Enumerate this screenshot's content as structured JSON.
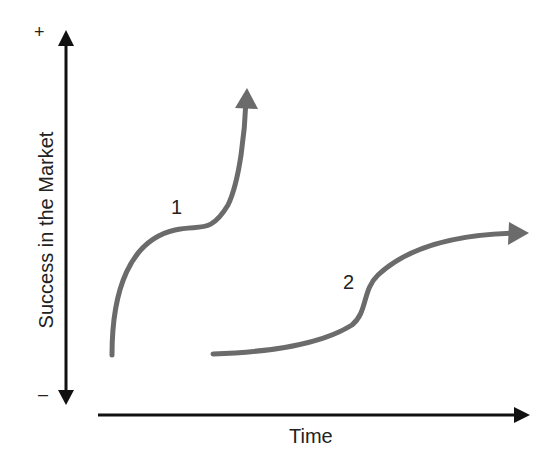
{
  "diagram": {
    "y_axis_label": "Success in the Market",
    "x_axis_label": "Time",
    "y_axis_top_marker": "+",
    "y_axis_bottom_marker": "–",
    "curves": [
      {
        "label": "1",
        "description": "steep rise, plateau, then sharp rise"
      },
      {
        "label": "2",
        "description": "slow rise, S-bend, then leveling off"
      }
    ],
    "colors": {
      "axis": "#111111",
      "curve": "#6b6b6b",
      "text": "#222222"
    }
  }
}
